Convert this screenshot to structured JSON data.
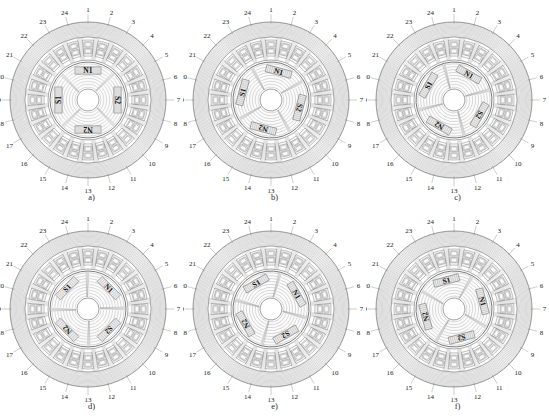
{
  "figure": {
    "name": "fem-flux-plot-grid",
    "rows": 2,
    "cols": 3,
    "background": "#ffffff",
    "line_color": "#6e6e6e",
    "text_color": "#1a1a1a"
  },
  "machine": {
    "stator_slot_count": 24,
    "rotor_pole_count": 4,
    "slot_numbers": [
      "1",
      "2",
      "3",
      "4",
      "5",
      "6",
      "7",
      "8",
      "9",
      "10",
      "11",
      "12",
      "13",
      "14",
      "15",
      "16",
      "17",
      "18",
      "19",
      "20",
      "21",
      "22",
      "23",
      "24"
    ],
    "magnet_labels": [
      "N1",
      "S2",
      "N2",
      "S1"
    ]
  },
  "panels": [
    {
      "id": "a",
      "caption": "a)",
      "rotor_angle_deg": 0,
      "magnets": [
        {
          "label": "N1",
          "angle_deg": -90
        },
        {
          "label": "S2",
          "angle_deg": 0
        },
        {
          "label": "N2",
          "angle_deg": 90
        },
        {
          "label": "S1",
          "angle_deg": 180
        }
      ]
    },
    {
      "id": "b",
      "caption": "b)",
      "rotor_angle_deg": 15,
      "magnets": [
        {
          "label": "N1",
          "angle_deg": -75
        },
        {
          "label": "S2",
          "angle_deg": 15
        },
        {
          "label": "N2",
          "angle_deg": 105
        },
        {
          "label": "S1",
          "angle_deg": 195
        }
      ]
    },
    {
      "id": "c",
      "caption": "c)",
      "rotor_angle_deg": 30,
      "magnets": [
        {
          "label": "N1",
          "angle_deg": -60
        },
        {
          "label": "S2",
          "angle_deg": 30
        },
        {
          "label": "N2",
          "angle_deg": 120
        },
        {
          "label": "S1",
          "angle_deg": 210
        }
      ]
    },
    {
      "id": "d",
      "caption": "d)",
      "rotor_angle_deg": 45,
      "magnets": [
        {
          "label": "N1",
          "angle_deg": -45
        },
        {
          "label": "S2",
          "angle_deg": 45
        },
        {
          "label": "N2",
          "angle_deg": 135
        },
        {
          "label": "S1",
          "angle_deg": 225
        }
      ]
    },
    {
      "id": "e",
      "caption": "e)",
      "rotor_angle_deg": 60,
      "magnets": [
        {
          "label": "N1",
          "angle_deg": -30
        },
        {
          "label": "S2",
          "angle_deg": 60
        },
        {
          "label": "N2",
          "angle_deg": 150
        },
        {
          "label": "S1",
          "angle_deg": 240
        }
      ]
    },
    {
      "id": "f",
      "caption": "f)",
      "rotor_angle_deg": 75,
      "magnets": [
        {
          "label": "N1",
          "angle_deg": -15
        },
        {
          "label": "S2",
          "angle_deg": 75
        },
        {
          "label": "N2",
          "angle_deg": 165
        },
        {
          "label": "S1",
          "angle_deg": 255
        }
      ]
    }
  ]
}
